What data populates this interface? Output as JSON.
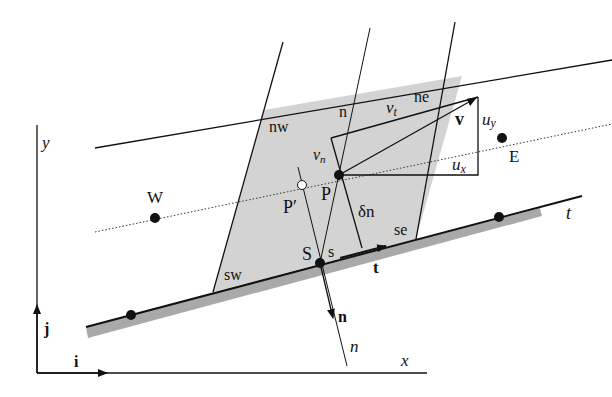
{
  "figure": {
    "colors": {
      "cell_fill": "#d3d3d3",
      "wall_shade": "#a9a9a9",
      "line": "#111111"
    },
    "labels": {
      "axis_y": "y",
      "axis_x": "x",
      "unit_i": "i",
      "unit_j": "j",
      "west": "W",
      "east": "E",
      "nw": "nw",
      "ne": "ne",
      "sw": "sw",
      "se": "se",
      "n_face": "n",
      "s_face": "s",
      "node_P": "P",
      "node_P_prime": "P′",
      "node_S": "S",
      "delta_n": "δn",
      "v_t": "v",
      "v_t_sub": "t",
      "v_n": "v",
      "v_n_sub": "n",
      "v_bold": "v",
      "u_x": "u",
      "u_x_sub": "x",
      "u_y": "u",
      "u_y_sub": "y",
      "t_vec": "t",
      "n_vec": "n",
      "t_axis": "t",
      "n_axis": "n"
    }
  }
}
